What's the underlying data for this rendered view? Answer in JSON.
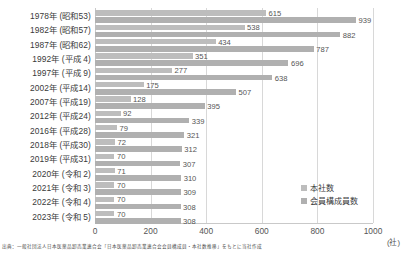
{
  "chart_data": {
    "type": "bar",
    "orientation": "horizontal",
    "title": "",
    "xlabel": "",
    "ylabel": "",
    "unit": "(社)",
    "xlim": [
      0,
      1000
    ],
    "xticks": [
      "0",
      "200",
      "400",
      "600",
      "800",
      "1000"
    ],
    "grid": true,
    "legend_position": "bottom-right",
    "categories": [
      "1978年 (昭和53)",
      "1982年 (昭和57)",
      "1987年 (昭和62)",
      "1992年 (平成  4)",
      "1997年 (平成  9)",
      "2002年 (平成14)",
      "2007年 (平成19)",
      "2012年 (平成24)",
      "2016年 (平成28)",
      "2018年 (平成30)",
      "2019年 (平成31)",
      "2020年 (令和  2)",
      "2021年 (令和  3)",
      "2022年 (令和  4)",
      "2023年 (令和  5)"
    ],
    "series": [
      {
        "name": "本社数",
        "color": "#bdbdbd",
        "values": [
          615,
          538,
          434,
          351,
          277,
          175,
          128,
          92,
          79,
          72,
          70,
          71,
          70,
          70,
          70
        ]
      },
      {
        "name": "会員構成員数",
        "color": "#b0b0b0",
        "values": [
          939,
          882,
          787,
          696,
          638,
          507,
          395,
          339,
          321,
          312,
          307,
          310,
          309,
          308,
          308
        ]
      }
    ]
  },
  "legend": {
    "items": [
      {
        "label": "本社数",
        "color": "#bdbdbd"
      },
      {
        "label": "会員構成員数",
        "color": "#b0b0b0"
      }
    ]
  },
  "footnote": {
    "text": "出典：一般社団法人日本医薬品卸売業連合会「日本医薬品卸売業連合会会員構成員・本社数推移」をもとに当社作成"
  }
}
